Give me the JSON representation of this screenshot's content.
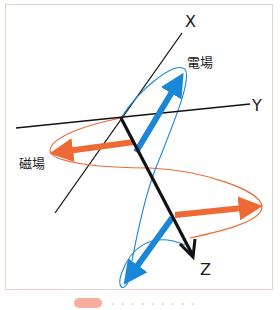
{
  "diagram": {
    "axes": {
      "x_label": "X",
      "y_label": "Y",
      "z_label": "Z"
    },
    "fields": {
      "electric_label": "電場",
      "magnetic_label": "磁場"
    },
    "colors": {
      "electric": "#1a86d8",
      "magnetic": "#ee6a35",
      "axis": "#111111",
      "frame_border": "#e8d3cc"
    },
    "caption": {
      "text": "・・・・・・・・・"
    }
  }
}
